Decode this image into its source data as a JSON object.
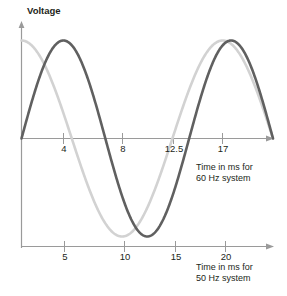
{
  "chart_data": {
    "type": "line",
    "title": "",
    "ylabel": "Voltage",
    "grid": false,
    "legend": "none",
    "axes": [
      {
        "name": "top-axis-60hz",
        "xlabel_line1": "Time in ms for",
        "xlabel_line2": "60 Hz system",
        "ticks": [
          4,
          8,
          12.5,
          17
        ],
        "tick_labels": [
          "4",
          "8",
          "12.5",
          "17"
        ],
        "unit": "ms",
        "frequency_hz": 60
      },
      {
        "name": "bottom-axis-50hz",
        "xlabel_line1": "Time in ms for",
        "xlabel_line2": "50 Hz system",
        "ticks": [
          5,
          10,
          15,
          20
        ],
        "tick_labels": [
          "5",
          "10",
          "15",
          "20"
        ],
        "unit": "ms",
        "frequency_hz": 50
      }
    ],
    "series": [
      {
        "name": "60 Hz waveform",
        "color": "#606060",
        "frequency_hz": 60,
        "period_ms": 16.7,
        "phase_deg": 0,
        "amplitude": 1,
        "x": [
          0,
          1,
          2,
          3,
          4,
          5,
          6,
          7,
          8,
          9,
          10,
          11,
          12,
          13,
          14,
          15,
          16,
          17,
          18,
          19,
          20,
          21,
          22,
          23,
          24,
          25
        ],
        "y": [
          0,
          0.37,
          0.69,
          0.91,
          1.0,
          0.95,
          0.76,
          0.47,
          0.12,
          -0.25,
          -0.59,
          -0.84,
          -0.98,
          -0.99,
          -0.86,
          -0.62,
          -0.3,
          0.07,
          0.43,
          0.73,
          0.93,
          1.0,
          0.93,
          0.73,
          0.44,
          0.08
        ]
      },
      {
        "name": "50 Hz waveform",
        "color": "#d2d2d2",
        "frequency_hz": 50,
        "period_ms": 20,
        "phase_deg": 90,
        "amplitude": 1,
        "x": [
          0,
          1,
          2,
          3,
          4,
          5,
          6,
          7,
          8,
          9,
          10,
          11,
          12,
          13,
          14,
          15,
          16,
          17,
          18,
          19,
          20,
          21,
          22,
          23,
          24,
          25
        ],
        "y": [
          1.0,
          0.95,
          0.81,
          0.59,
          0.31,
          0.0,
          -0.31,
          -0.59,
          -0.81,
          -0.95,
          -1.0,
          -0.95,
          -0.81,
          -0.59,
          -0.31,
          0.0,
          0.31,
          0.59,
          0.81,
          0.95,
          1.0,
          0.95,
          0.81,
          0.59,
          0.31,
          0.0
        ]
      }
    ],
    "xlim": [
      0,
      25
    ],
    "ylim": [
      -1.05,
      1.05
    ]
  },
  "axis_title_y": "Voltage",
  "top_axis": {
    "tick_labels": [
      "4",
      "8",
      "12.5",
      "17"
    ],
    "title_line1": "Time in ms for",
    "title_line2": "60 Hz system"
  },
  "bottom_axis": {
    "tick_labels": [
      "5",
      "10",
      "15",
      "20"
    ],
    "title_line1": "Time in ms for",
    "title_line2": "50 Hz system"
  },
  "colors": {
    "wave_60hz": "#606060",
    "wave_50hz": "#d2d2d2",
    "axis": "#9a9a9a",
    "text": "#231f20",
    "background": "#ffffff"
  }
}
